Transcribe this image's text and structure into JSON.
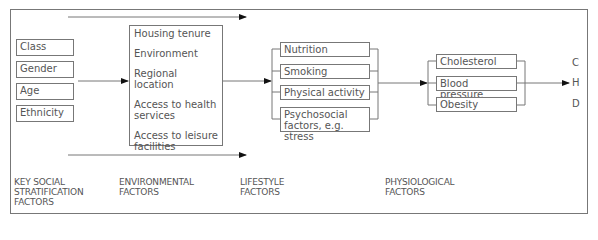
{
  "diagram": {
    "columns": [
      {
        "id": "social",
        "label_lines": [
          "KEY SOCIAL",
          "STRATIFICATION",
          "FACTORS"
        ],
        "items": [
          "Class",
          "Gender",
          "Age",
          "Ethnicity"
        ]
      },
      {
        "id": "environmental",
        "label_lines": [
          "ENVIRONMENTAL",
          "FACTORS"
        ],
        "items": [
          "Housing tenure",
          "Environment",
          "Regional location",
          "Access to health services",
          "Access to leisure facilities"
        ]
      },
      {
        "id": "lifestyle",
        "label_lines": [
          "LIFESTYLE",
          "FACTORS"
        ],
        "items": [
          "Nutrition",
          "Smoking",
          "Physical activity",
          "Psychosocial factors, e.g. stress"
        ]
      },
      {
        "id": "physiological",
        "label_lines": [
          "PHYSIOLOGICAL",
          "FACTORS"
        ],
        "items": [
          "Cholesterol",
          "Blood pressure",
          "Obesity"
        ]
      }
    ],
    "outcomes": [
      "C",
      "H",
      "D"
    ],
    "colors": {
      "line": "#777777",
      "text": "#555555",
      "arrowhead": "#111111",
      "background": "#ffffff"
    }
  }
}
